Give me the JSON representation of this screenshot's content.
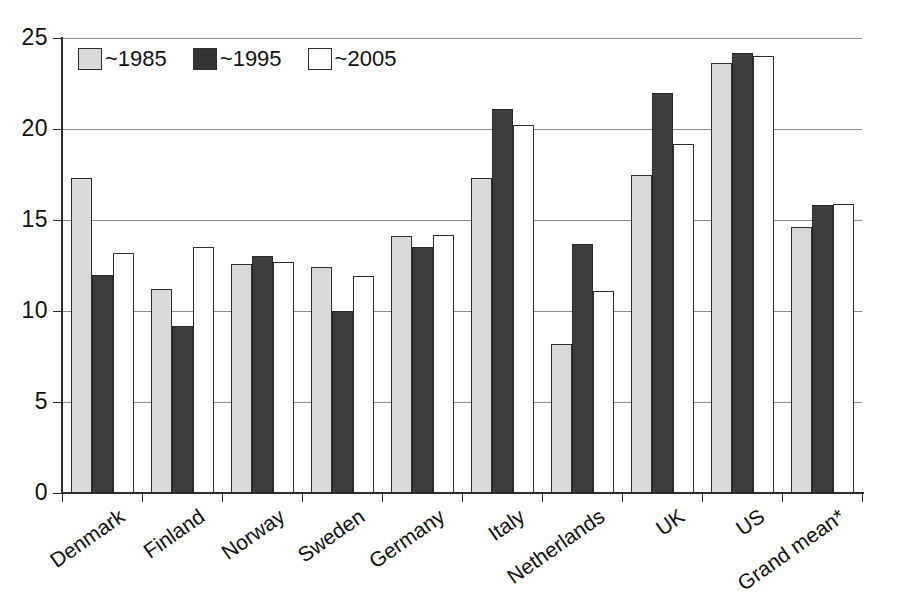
{
  "chart_data": {
    "type": "bar",
    "title": "",
    "subtitle": "",
    "xlabel": "",
    "ylabel": "",
    "ylim": [
      0,
      25
    ],
    "yticks": [
      0,
      5,
      10,
      15,
      20,
      25
    ],
    "ytick_labels": [
      "0",
      "5",
      "10",
      "15",
      "20",
      "25"
    ],
    "grid": true,
    "legend_position": "top-left",
    "categories": [
      "Denmark",
      "Finland",
      "Norway",
      "Sweden",
      "Germany",
      "Italy",
      "Netherlands",
      "UK",
      "US",
      "Grand mean*"
    ],
    "series": [
      {
        "name": "~1985",
        "color": "#d9d9d9",
        "values": [
          17.3,
          11.2,
          12.6,
          12.4,
          14.1,
          17.3,
          8.2,
          17.5,
          23.6,
          14.6
        ]
      },
      {
        "name": "~1995",
        "color": "#3d3d3d",
        "values": [
          12.0,
          9.2,
          13.0,
          10.0,
          13.5,
          21.1,
          13.7,
          22.0,
          24.2,
          15.8
        ]
      },
      {
        "name": "~2005",
        "color": "#ffffff",
        "values": [
          13.2,
          13.5,
          12.7,
          11.9,
          14.2,
          20.2,
          11.1,
          19.2,
          24.0,
          15.9
        ]
      }
    ]
  },
  "legend": {
    "entries": [
      {
        "label": "~1985",
        "swatch": "s1985"
      },
      {
        "label": "~1995",
        "swatch": "s1995"
      },
      {
        "label": "~2005",
        "swatch": "s2005"
      }
    ]
  }
}
